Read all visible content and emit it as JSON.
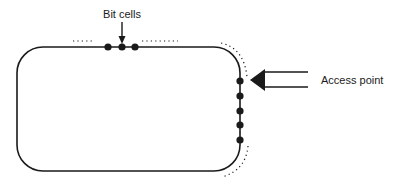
{
  "diagram": {
    "labels": {
      "bit_cells": "Bit cells",
      "access_point": "Access point"
    },
    "colors": {
      "stroke": "#1a1a1a",
      "background": "#ffffff"
    },
    "loop": {
      "x": 17,
      "y": 47,
      "width": 223,
      "height": 124,
      "corner_radius": 26
    },
    "top_bit_cells_x": [
      108,
      122,
      135
    ],
    "right_bit_cells_y": [
      81,
      96,
      111,
      125,
      140
    ]
  }
}
